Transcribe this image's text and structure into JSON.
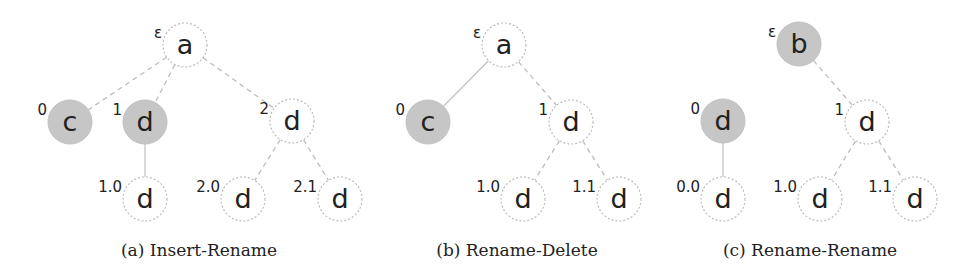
{
  "figure": {
    "panels": [
      {
        "id": "a",
        "caption": "(a) Insert-Rename",
        "caption_x": 199,
        "nodes": [
          {
            "id": "root",
            "label": "a",
            "pos": "ε",
            "x": 185,
            "y": 45,
            "shaded": false
          },
          {
            "id": "n0",
            "label": "c",
            "pos": "0",
            "x": 70,
            "y": 122,
            "shaded": true
          },
          {
            "id": "n1",
            "label": "d",
            "pos": "1",
            "x": 145,
            "y": 122,
            "shaded": true
          },
          {
            "id": "n2",
            "label": "d",
            "pos": "2",
            "x": 292,
            "y": 121,
            "shaded": false
          },
          {
            "id": "n10",
            "label": "d",
            "pos": "1.0",
            "x": 145,
            "y": 199,
            "shaded": false
          },
          {
            "id": "n20",
            "label": "d",
            "pos": "2.0",
            "x": 243,
            "y": 199,
            "shaded": false
          },
          {
            "id": "n21",
            "label": "d",
            "pos": "2.1",
            "x": 340,
            "y": 199,
            "shaded": false
          }
        ],
        "edges": [
          {
            "from": "root",
            "to": "n0",
            "style": "dashed"
          },
          {
            "from": "root",
            "to": "n1",
            "style": "dashed"
          },
          {
            "from": "root",
            "to": "n2",
            "style": "dashed"
          },
          {
            "from": "n1",
            "to": "n10",
            "style": "solid"
          },
          {
            "from": "n2",
            "to": "n20",
            "style": "dashed"
          },
          {
            "from": "n2",
            "to": "n21",
            "style": "dashed"
          }
        ]
      },
      {
        "id": "b",
        "caption": "(b) Rename-Delete",
        "caption_x": 517,
        "nodes": [
          {
            "id": "root",
            "label": "a",
            "pos": "ε",
            "x": 504,
            "y": 45,
            "shaded": false
          },
          {
            "id": "n0",
            "label": "c",
            "pos": "0",
            "x": 428,
            "y": 122,
            "shaded": true
          },
          {
            "id": "n1",
            "label": "d",
            "pos": "1",
            "x": 571,
            "y": 122,
            "shaded": false
          },
          {
            "id": "n10",
            "label": "d",
            "pos": "1.0",
            "x": 523,
            "y": 199,
            "shaded": false
          },
          {
            "id": "n11",
            "label": "d",
            "pos": "1.1",
            "x": 619,
            "y": 199,
            "shaded": false
          }
        ],
        "edges": [
          {
            "from": "root",
            "to": "n0",
            "style": "solid"
          },
          {
            "from": "root",
            "to": "n1",
            "style": "dashed"
          },
          {
            "from": "n1",
            "to": "n10",
            "style": "dashed"
          },
          {
            "from": "n1",
            "to": "n11",
            "style": "dashed"
          }
        ]
      },
      {
        "id": "c",
        "caption": "(c) Rename-Rename",
        "caption_x": 810,
        "nodes": [
          {
            "id": "root",
            "label": "b",
            "pos": "ε",
            "x": 799,
            "y": 44,
            "shaded": true
          },
          {
            "id": "n0",
            "label": "d",
            "pos": "0",
            "x": 723,
            "y": 121,
            "shaded": true
          },
          {
            "id": "n1",
            "label": "d",
            "pos": "1",
            "x": 867,
            "y": 122,
            "shaded": false
          },
          {
            "id": "n00",
            "label": "d",
            "pos": "0.0",
            "x": 723,
            "y": 199,
            "shaded": false
          },
          {
            "id": "n10",
            "label": "d",
            "pos": "1.0",
            "x": 820,
            "y": 199,
            "shaded": false
          },
          {
            "id": "n11",
            "label": "d",
            "pos": "1.1",
            "x": 915,
            "y": 199,
            "shaded": false
          }
        ],
        "edges": [
          {
            "from": "root",
            "to": "n1",
            "style": "dashed"
          },
          {
            "from": "n0",
            "to": "n00",
            "style": "solid"
          },
          {
            "from": "n1",
            "to": "n10",
            "style": "dashed"
          },
          {
            "from": "n1",
            "to": "n11",
            "style": "dashed"
          }
        ]
      }
    ],
    "colors": {
      "shaded_fill": "#c6c6c6",
      "edge": "#bdbdbd",
      "text": "#222222"
    },
    "node_radius": 22
  }
}
